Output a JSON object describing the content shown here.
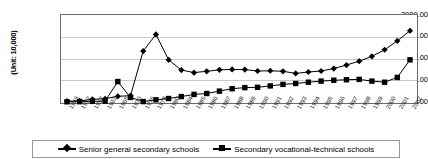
{
  "chart_data": {
    "type": "line",
    "title": "",
    "xlabel": "",
    "ylabel": "(Unit: 10,000)",
    "ylim": [
      0,
      2000
    ],
    "yticks": [
      "0.00",
      "500.00",
      "1000.00",
      "1500.00",
      "2000.00"
    ],
    "grid": true,
    "legend_position": "bottom",
    "categories": [
      "1949",
      "1952",
      "1957",
      "1962",
      "1965",
      "1970",
      "1975",
      "1978",
      "1980",
      "1984",
      "1985",
      "1986",
      "1987",
      "1988",
      "1989",
      "1990",
      "1991",
      "1992",
      "1993",
      "1994",
      "1995",
      "1996",
      "1997",
      "1998",
      "1999",
      "2000",
      "2001",
      "2002"
    ],
    "series": [
      {
        "name": "Senior general secondary schools",
        "marker": "diamond",
        "values": [
          20,
          25,
          63,
          75,
          130,
          145,
          1170,
          1553,
          970,
          735,
          675,
          705,
          740,
          748,
          745,
          713,
          718,
          705,
          657,
          690,
          713,
          769,
          850,
          938,
          1050,
          1201,
          1405,
          1638
        ]
      },
      {
        "name": "Secondary vocational-technical schools",
        "marker": "square",
        "values": [
          5,
          8,
          15,
          20,
          470,
          105,
          10,
          50,
          80,
          125,
          175,
          195,
          250,
          305,
          330,
          338,
          370,
          405,
          425,
          455,
          480,
          500,
          512,
          520,
          480,
          455,
          565,
          970
        ]
      }
    ]
  },
  "legend": {
    "entries": [
      {
        "label": "Senior general secondary schools"
      },
      {
        "label": "Secondary vocational-technical schools"
      }
    ]
  }
}
